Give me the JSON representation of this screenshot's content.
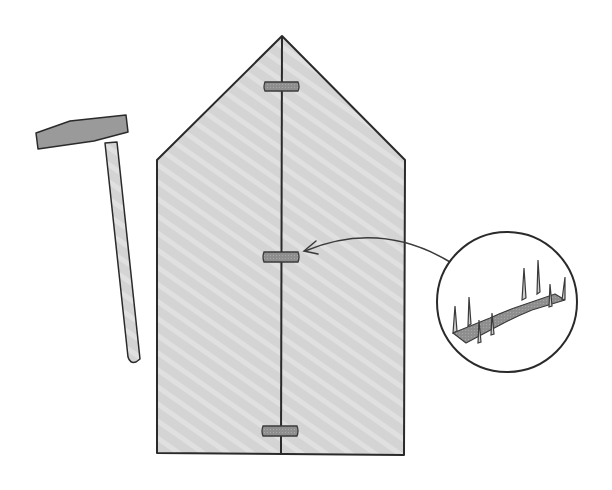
{
  "illustration": {
    "title": "Joining two boards with corrugated fasteners",
    "objects": [
      "hammer",
      "two-board-panel",
      "corrugated-fastener",
      "callout-magnifier",
      "pointer-arrow"
    ],
    "fastener_count_on_seam": 3,
    "colors": {
      "background": "#ffffff",
      "board_fill": "#d4d4d4",
      "board_stripe": "#e2e2e2",
      "outline": "#2a2a2a",
      "fastener_fill": "#8c8c8c",
      "hammer_head": "#9a9a9a",
      "hammer_handle": "#b8b8b8"
    }
  }
}
